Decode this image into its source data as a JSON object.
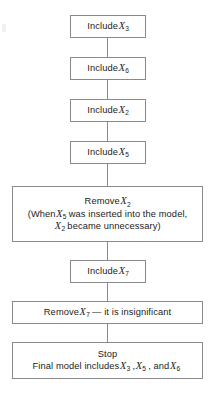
{
  "diagram": {
    "orientation": "vertical-top-to-bottom",
    "border_color": "#8a8a8a",
    "background_color": "#ffffff",
    "text_color": "#1b1b1b",
    "nodes": [
      {
        "id": "include-x3",
        "width": "narrow",
        "lines": [
          {
            "text": "Include ",
            "var": "X",
            "sub": "3"
          }
        ]
      },
      {
        "id": "include-x6",
        "width": "narrow",
        "lines": [
          {
            "text": "Include ",
            "var": "X",
            "sub": "6"
          }
        ]
      },
      {
        "id": "include-x2",
        "width": "narrow",
        "lines": [
          {
            "text": "Include ",
            "var": "X",
            "sub": "2"
          }
        ]
      },
      {
        "id": "include-x5",
        "width": "narrow",
        "lines": [
          {
            "text": "Include ",
            "var": "X",
            "sub": "5"
          }
        ]
      },
      {
        "id": "remove-x2",
        "width": "wide",
        "lines": [
          {
            "text": "Remove ",
            "var": "X",
            "sub": "2"
          },
          {
            "text": "(When ",
            "var": "X",
            "sub": "5",
            "after": " was inserted into the model,"
          },
          {
            "text": "",
            "var": "X",
            "sub": "2",
            "after": " became unnecessary)"
          }
        ]
      },
      {
        "id": "include-x7",
        "width": "narrow",
        "lines": [
          {
            "text": "Include ",
            "var": "X",
            "sub": "7"
          }
        ]
      },
      {
        "id": "remove-x7",
        "width": "wide",
        "lines": [
          {
            "text": "Remove ",
            "var": "X",
            "sub": "7",
            "after": " — it is insignificant"
          }
        ]
      },
      {
        "id": "stop",
        "width": "wide",
        "lines": [
          {
            "text": "Stop"
          },
          {
            "text": "Final model includes ",
            "var": "X",
            "sub": "3",
            "after": ", ",
            "var2": "X",
            "sub2": "5",
            "after2": ", and ",
            "var3": "X",
            "sub3": "6"
          }
        ]
      }
    ],
    "labels": {
      "include": "Include",
      "remove": "Remove",
      "stop": "Stop",
      "when_prefix": "(When",
      "inserted_phrase": "was inserted into the model,",
      "unnecessary_phrase": "became unnecessary)",
      "insignificant_phrase": "— it is insignificant",
      "final_model_prefix": "Final model includes",
      "comma": ",",
      "and_sep": ", and",
      "variable_symbol": "X"
    },
    "subscripts": {
      "s3": "3",
      "s6": "6",
      "s2": "2",
      "s5": "5",
      "s7": "7"
    },
    "connector_count": 7
  }
}
